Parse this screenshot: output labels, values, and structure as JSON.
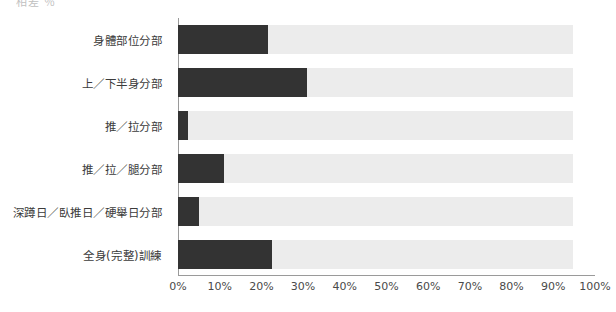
{
  "clipped_top_text": "相差  ％",
  "chart_data": {
    "type": "bar",
    "orientation": "horizontal",
    "title": "",
    "subtitle": "",
    "xlabel": "",
    "ylabel": "",
    "xlim": [
      0,
      100
    ],
    "grid": false,
    "legend": null,
    "axis_unit": "%",
    "categories": [
      "身體部位分部",
      "上／下半身分部",
      "推／拉分部",
      "推／拉／腿分部",
      "深蹲日／臥推日／硬舉日分部",
      "全身(完整)訓練"
    ],
    "values": [
      21.6,
      31.0,
      2.4,
      11.0,
      5.0,
      22.5
    ],
    "tick_labels": [
      "0%",
      "10%",
      "20%",
      "30%",
      "40%",
      "50%",
      "60%",
      "70%",
      "80%",
      "90%",
      "100%"
    ],
    "tick_values": [
      0,
      10,
      20,
      30,
      40,
      50,
      60,
      70,
      80,
      90,
      100
    ],
    "colors": {
      "bar_fill": "#333333",
      "bar_track": "#ececec",
      "axis": "#9a9a9a",
      "text": "#3b3b3b",
      "background": "#ffffff"
    }
  }
}
